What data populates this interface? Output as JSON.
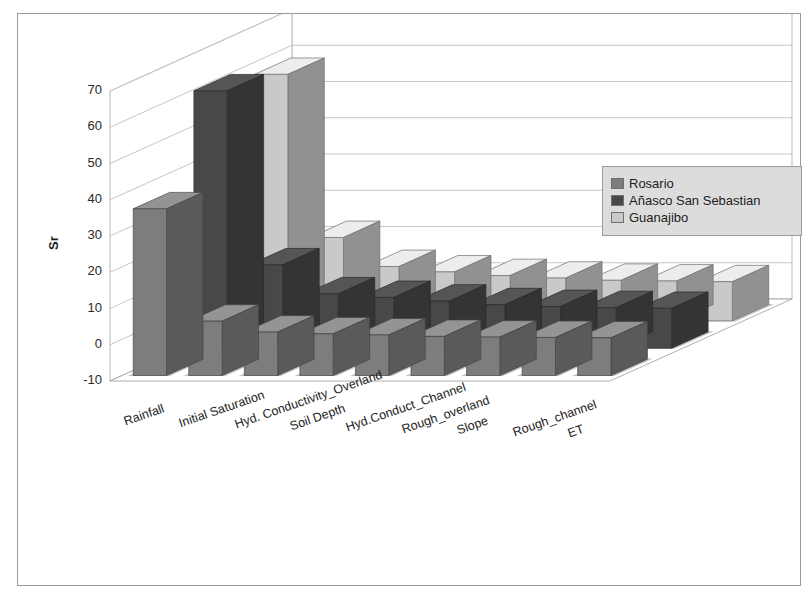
{
  "chart_data": {
    "type": "bar",
    "render": "3d-clustered-column",
    "title": "Relative sensitivity Coefficient",
    "subtitle": "Runoff Depth",
    "xlabel": "",
    "ylabel": "Sr",
    "ylim": [
      -10,
      70
    ],
    "yticks": [
      70,
      60,
      50,
      40,
      30,
      20,
      10,
      0,
      -10
    ],
    "grid": true,
    "legend_position": "right",
    "categories": [
      "Rainfall",
      "Initial Saturation",
      "Hyd. Conductivity_Overland",
      "Soil Depth",
      "Hyd.Conduct_Channel",
      "Rough_overland",
      "Slope",
      "Rough_channel",
      "ET"
    ],
    "series": [
      {
        "name": "Rosario",
        "color": "#7d7d7d",
        "values": [
          36,
          5,
          2,
          1.5,
          1.2,
          0.8,
          0.6,
          0.5,
          0.4
        ]
      },
      {
        "name": "Añasco San Sebastian",
        "color": "#484848",
        "values": [
          61,
          13,
          5,
          4,
          3,
          2,
          1.5,
          1.2,
          1
        ]
      },
      {
        "name": "Guanajibo",
        "color": "#c9c9c9",
        "values": [
          58,
          13,
          5,
          3.5,
          2.5,
          1.8,
          1.2,
          1,
          0.8
        ]
      }
    ]
  },
  "legend": {
    "items": [
      {
        "label": "Rosario"
      },
      {
        "label": "Añasco San Sebastian"
      },
      {
        "label": "Guanajibo"
      }
    ]
  }
}
